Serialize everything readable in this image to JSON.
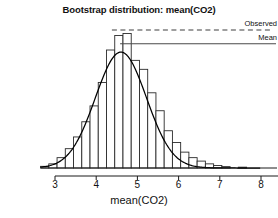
{
  "chart_data": {
    "type": "bar",
    "title": "Bootstrap distribution: mean(CO2)",
    "subtitle": "",
    "xlabel": "mean(CO2)",
    "ylabel": "",
    "xlim": [
      2.65,
      8.0
    ],
    "ylim": [
      0,
      1.0
    ],
    "grid": false,
    "legend_position": "right-inline",
    "xticks": [
      3,
      4,
      5,
      6,
      7,
      8
    ],
    "xtick_labels": [
      "3",
      "4",
      "5",
      "6",
      "7",
      "8"
    ],
    "categories": [
      2.75,
      2.95,
      3.15,
      3.35,
      3.55,
      3.75,
      3.95,
      4.15,
      4.35,
      4.55,
      4.75,
      4.95,
      5.15,
      5.35,
      5.55,
      5.75,
      5.95,
      6.15,
      6.35,
      6.55,
      6.75,
      6.95,
      7.15,
      7.55
    ],
    "bin_width": 0.2,
    "values": [
      0.012,
      0.03,
      0.075,
      0.14,
      0.225,
      0.335,
      0.45,
      0.62,
      0.855,
      0.96,
      0.975,
      0.78,
      0.715,
      0.545,
      0.415,
      0.27,
      0.185,
      0.115,
      0.075,
      0.05,
      0.03,
      0.018,
      0.01,
      0.006
    ],
    "density_curve": {
      "name": "density",
      "mean": 4.6,
      "sd": 0.62,
      "peak_value": 0.84
    },
    "annotations": [
      {
        "name": "observed",
        "label": "Observed",
        "style": "dashed",
        "y_value": 1.0
      },
      {
        "name": "mean",
        "label": "Mean",
        "style": "solid",
        "y_value": 0.9
      }
    ]
  },
  "legend": {
    "observed_label": "Observed",
    "mean_label": "Mean"
  },
  "colors": {
    "axis": "#1a1a1a",
    "bar_stroke": "#2b2b2b",
    "bar_fill": "#ffffff",
    "curve": "#000000",
    "reference_line": "#444444",
    "background": "#ffffff"
  }
}
